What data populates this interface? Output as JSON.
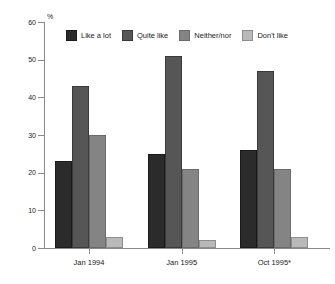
{
  "chart_data": {
    "type": "bar",
    "title": "",
    "subtitle": "",
    "xlabel": "",
    "ylabel": "%",
    "ylim": [
      0,
      60
    ],
    "yticks": [
      0,
      10,
      20,
      30,
      40,
      50,
      60
    ],
    "grid": false,
    "legend_position": "top-inside",
    "categories": [
      "Jan 1994",
      "Jan 1995",
      "Oct 1995*"
    ],
    "series": [
      {
        "name": "Like a lot",
        "color": "#2b2b2b",
        "values": [
          23,
          25,
          26
        ]
      },
      {
        "name": "Quite like",
        "color": "#565656",
        "values": [
          43,
          51,
          47
        ]
      },
      {
        "name": "Neither/nor",
        "color": "#848484",
        "values": [
          30,
          21,
          21
        ]
      },
      {
        "name": "Don't like",
        "color": "#b9b9b9",
        "values": [
          3,
          2,
          3
        ]
      }
    ],
    "annotations": [
      "* asterisk on Oct 1995 category label"
    ]
  },
  "axis": {
    "y_unit_label": "%",
    "y_tick_labels": [
      "0",
      "10",
      "20",
      "30",
      "40",
      "50",
      "60"
    ],
    "x_tick_labels": [
      "Jan 1994",
      "Jan 1995",
      "Oct 1995*"
    ]
  },
  "legend": {
    "items": [
      {
        "label": "Like a lot"
      },
      {
        "label": "Quite like"
      },
      {
        "label": "Neither/nor"
      },
      {
        "label": "Don't like"
      }
    ]
  }
}
